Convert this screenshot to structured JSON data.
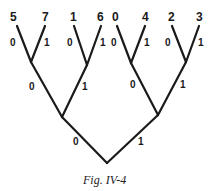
{
  "diagram": {
    "type": "binary-tree",
    "leaves": [
      "5",
      "7",
      "1",
      "6",
      "0",
      "4",
      "2",
      "3"
    ],
    "edge_labels": {
      "level3": [
        "0",
        "1",
        "0",
        "1",
        "0",
        "1",
        "0",
        "1"
      ],
      "level2": [
        "0",
        "1",
        "0",
        "1"
      ],
      "level1": [
        "0",
        "1"
      ]
    },
    "caption": "Fig. IV-4"
  }
}
